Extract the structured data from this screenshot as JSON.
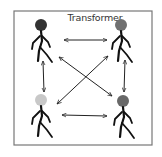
{
  "title": "Transformer",
  "frame": {
    "x": 14,
    "y": 11,
    "w": 138,
    "h": 134,
    "stroke": "#777777"
  },
  "figures": [
    {
      "id": "top-left",
      "x": 41,
      "y": 25,
      "head_color": "#333333"
    },
    {
      "id": "top-right",
      "x": 121,
      "y": 25,
      "head_color": "#707070"
    },
    {
      "id": "bottom-left",
      "x": 41,
      "y": 100,
      "head_color": "#c8c8c8"
    },
    {
      "id": "bottom-right",
      "x": 123,
      "y": 101,
      "head_color": "#686868"
    }
  ],
  "arrows": [
    {
      "name": "top-horizontal",
      "x1": 64,
      "y1": 40,
      "x2": 107,
      "y2": 40
    },
    {
      "name": "bottom-horizontal",
      "x1": 62,
      "y1": 115,
      "x2": 107,
      "y2": 116
    },
    {
      "name": "left-vertical",
      "x1": 43,
      "y1": 61,
      "x2": 44,
      "y2": 92
    },
    {
      "name": "right-vertical",
      "x1": 125,
      "y1": 60,
      "x2": 124,
      "y2": 92
    },
    {
      "name": "diagonal-tl-br",
      "x1": 59,
      "y1": 57,
      "x2": 112,
      "y2": 96
    },
    {
      "name": "diagonal-tr-bl",
      "x1": 108,
      "y1": 56,
      "x2": 57,
      "y2": 104
    }
  ]
}
